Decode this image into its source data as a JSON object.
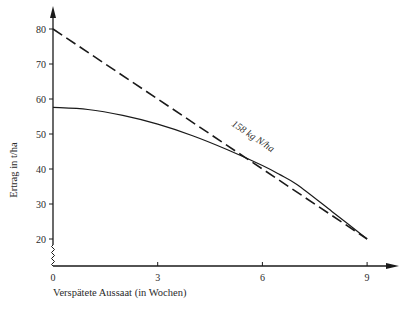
{
  "chart_data": {
    "type": "line",
    "title": "",
    "xlabel": "Verspätete Aussaat (in Wochen)",
    "ylabel": "Ertrag in t/ha",
    "xlim": [
      0,
      10
    ],
    "ylim": [
      12,
      85
    ],
    "x_ticks": [
      0,
      3,
      6,
      9
    ],
    "y_ticks": [
      20,
      30,
      40,
      50,
      60,
      70,
      80
    ],
    "grid": false,
    "legend": null,
    "y_axis_break": true,
    "series": [
      {
        "name": "158 kg N/ha",
        "style": "dashed",
        "x": [
          0,
          9
        ],
        "y": [
          80,
          20
        ]
      },
      {
        "name": "ohne Angabe (solid)",
        "style": "solid",
        "x": [
          0,
          1,
          2,
          3,
          4,
          5,
          6,
          6.5,
          7,
          8,
          9
        ],
        "y": [
          57.6,
          57.0,
          55.3,
          52.8,
          49.5,
          45.5,
          41.0,
          38.4,
          35.5,
          27.8,
          20
        ]
      }
    ],
    "annotations": [
      {
        "text": "158 kg N/ha",
        "x": 5.1,
        "y": 52.5,
        "attached_to": "dashed"
      }
    ]
  },
  "labels": {
    "ylabel": "Ertrag in t/ha",
    "xlabel": "Verspätete Aussaat (in Wochen)",
    "annotation": "158 kg N/ha"
  }
}
